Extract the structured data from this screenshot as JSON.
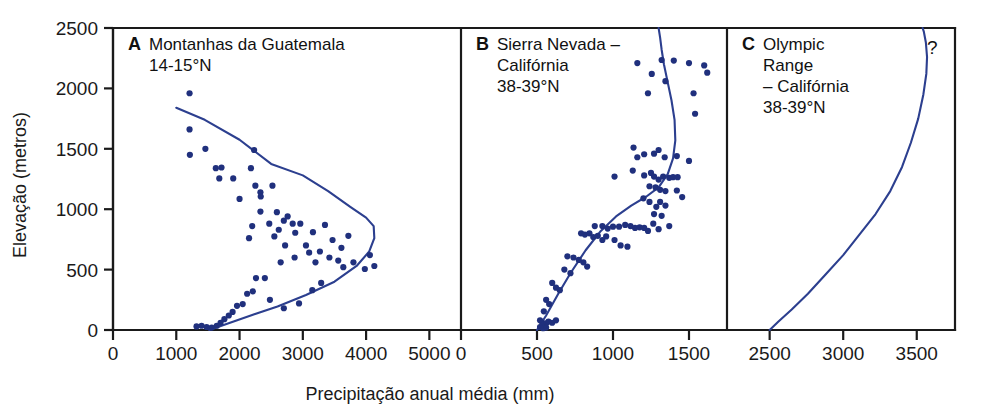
{
  "figure": {
    "axis_titles": {
      "x": "Precipitação anual média (mm)",
      "y": "Elevação (metros)"
    },
    "colors": {
      "point": "#20307d",
      "curve": "#2c3f8f",
      "axis": "#1a1a1a",
      "background": "#ffffff"
    }
  },
  "chart_data": {
    "type": "scatter",
    "title": "",
    "xlabel": "Precipitação anual média (mm)",
    "ylabel": "Elevação (metros)",
    "grid": false,
    "legend": "none",
    "shared_y": {
      "label": "Elevação (metros)",
      "ticks": [
        0,
        500,
        1000,
        1500,
        2000,
        2500
      ],
      "ylim": [
        0,
        2500
      ]
    },
    "panels": [
      {
        "letter": "A",
        "title_lines": [
          "Montanhas da Guatemala",
          "14-15°N"
        ],
        "region": "Montanhas da Guatemala",
        "latitude": "14-15°N",
        "xlim": [
          0,
          5500
        ],
        "xticks": [
          0,
          1000,
          2000,
          3000,
          4000,
          5000
        ],
        "xtick_labels": [
          "0",
          "1000",
          "2000",
          "3000",
          "4000",
          "5000"
        ],
        "annotation": "",
        "points": [
          [
            1210,
            1960
          ],
          [
            1210,
            1660
          ],
          [
            1215,
            1450
          ],
          [
            1460,
            1500
          ],
          [
            1625,
            1340
          ],
          [
            1680,
            1255
          ],
          [
            1715,
            1345
          ],
          [
            1900,
            1255
          ],
          [
            2000,
            1085
          ],
          [
            2180,
            1340
          ],
          [
            2230,
            1490
          ],
          [
            2250,
            1195
          ],
          [
            2330,
            1140
          ],
          [
            2335,
            1105
          ],
          [
            2520,
            1195
          ],
          [
            2590,
            975
          ],
          [
            2330,
            980
          ],
          [
            2200,
            860
          ],
          [
            2150,
            760
          ],
          [
            2470,
            880
          ],
          [
            2550,
            775
          ],
          [
            2620,
            830
          ],
          [
            2700,
            905
          ],
          [
            2720,
            700
          ],
          [
            2760,
            940
          ],
          [
            2840,
            880
          ],
          [
            2880,
            805
          ],
          [
            2960,
            880
          ],
          [
            3050,
            700
          ],
          [
            3100,
            640
          ],
          [
            3160,
            810
          ],
          [
            3200,
            560
          ],
          [
            3270,
            650
          ],
          [
            3350,
            870
          ],
          [
            3420,
            600
          ],
          [
            3470,
            745
          ],
          [
            3560,
            575
          ],
          [
            3610,
            680
          ],
          [
            3640,
            520
          ],
          [
            3720,
            780
          ],
          [
            3800,
            560
          ],
          [
            3980,
            505
          ],
          [
            4060,
            620
          ],
          [
            4130,
            530
          ],
          [
            2870,
            600
          ],
          [
            2650,
            560
          ],
          [
            2400,
            430
          ],
          [
            2260,
            430
          ],
          [
            2210,
            320
          ],
          [
            2120,
            300
          ],
          [
            2050,
            215
          ],
          [
            1960,
            200
          ],
          [
            1890,
            150
          ],
          [
            1830,
            120
          ],
          [
            1760,
            90
          ],
          [
            1700,
            60
          ],
          [
            1640,
            35
          ],
          [
            1560,
            20
          ],
          [
            1480,
            25
          ],
          [
            1400,
            35
          ],
          [
            1320,
            30
          ],
          [
            2480,
            250
          ],
          [
            2700,
            180
          ],
          [
            2940,
            220
          ],
          [
            3150,
            330
          ],
          [
            3290,
            390
          ]
        ],
        "curve": [
          [
            1000,
            1840
          ],
          [
            1450,
            1740
          ],
          [
            2000,
            1575
          ],
          [
            2500,
            1375
          ],
          [
            3000,
            1280
          ],
          [
            3400,
            1150
          ],
          [
            3750,
            1020
          ],
          [
            4000,
            930
          ],
          [
            4120,
            860
          ],
          [
            4130,
            760
          ],
          [
            4050,
            650
          ],
          [
            3850,
            530
          ],
          [
            3500,
            400
          ],
          [
            3050,
            290
          ],
          [
            2600,
            195
          ],
          [
            2200,
            125
          ],
          [
            1850,
            60
          ],
          [
            1580,
            10
          ],
          [
            1520,
            0
          ]
        ]
      },
      {
        "letter": "B",
        "title_lines": [
          "Sierra Nevada –",
          "Califórnia",
          "38-39°N"
        ],
        "region": "Sierra Nevada – Califórnia",
        "latitude": "38-39°N",
        "xlim": [
          0,
          1750
        ],
        "xticks": [
          0,
          500,
          1000,
          1500
        ],
        "xtick_labels": [
          "0",
          "500",
          "1000",
          "1500"
        ],
        "annotation": "",
        "points": [
          [
            1160,
            2210
          ],
          [
            1320,
            2235
          ],
          [
            1400,
            2230
          ],
          [
            1500,
            2210
          ],
          [
            1255,
            2120
          ],
          [
            1345,
            2060
          ],
          [
            1230,
            1960
          ],
          [
            1530,
            1960
          ],
          [
            1600,
            2190
          ],
          [
            1620,
            2130
          ],
          [
            1540,
            1790
          ],
          [
            1135,
            1510
          ],
          [
            1160,
            1430
          ],
          [
            1205,
            1455
          ],
          [
            1270,
            1460
          ],
          [
            1300,
            1490
          ],
          [
            1340,
            1430
          ],
          [
            1420,
            1440
          ],
          [
            1500,
            1400
          ],
          [
            1010,
            1270
          ],
          [
            1130,
            1320
          ],
          [
            1205,
            1280
          ],
          [
            1250,
            1300
          ],
          [
            1270,
            1270
          ],
          [
            1300,
            1245
          ],
          [
            1330,
            1270
          ],
          [
            1370,
            1260
          ],
          [
            1395,
            1265
          ],
          [
            1425,
            1265
          ],
          [
            1240,
            1190
          ],
          [
            1280,
            1180
          ],
          [
            1310,
            1160
          ],
          [
            1345,
            1150
          ],
          [
            1420,
            1155
          ],
          [
            1455,
            1100
          ],
          [
            1200,
            1090
          ],
          [
            1240,
            1060
          ],
          [
            1285,
            1020
          ],
          [
            1310,
            1060
          ],
          [
            1345,
            1030
          ],
          [
            1270,
            960
          ],
          [
            1320,
            945
          ],
          [
            880,
            860
          ],
          [
            930,
            860
          ],
          [
            965,
            840
          ],
          [
            1000,
            855
          ],
          [
            1040,
            855
          ],
          [
            1080,
            870
          ],
          [
            1115,
            860
          ],
          [
            1145,
            845
          ],
          [
            1175,
            850
          ],
          [
            1205,
            845
          ],
          [
            1230,
            820
          ],
          [
            1265,
            880
          ],
          [
            1300,
            835
          ],
          [
            1370,
            860
          ],
          [
            790,
            800
          ],
          [
            815,
            790
          ],
          [
            845,
            800
          ],
          [
            870,
            770
          ],
          [
            900,
            780
          ],
          [
            930,
            745
          ],
          [
            955,
            775
          ],
          [
            1010,
            745
          ],
          [
            1050,
            700
          ],
          [
            1095,
            690
          ],
          [
            700,
            610
          ],
          [
            740,
            600
          ],
          [
            775,
            580
          ],
          [
            805,
            560
          ],
          [
            830,
            525
          ],
          [
            680,
            500
          ],
          [
            720,
            470
          ],
          [
            600,
            390
          ],
          [
            625,
            350
          ],
          [
            650,
            330
          ],
          [
            560,
            250
          ],
          [
            580,
            215
          ],
          [
            545,
            155
          ],
          [
            520,
            80
          ],
          [
            535,
            60
          ],
          [
            545,
            45
          ],
          [
            560,
            55
          ],
          [
            575,
            70
          ],
          [
            600,
            60
          ],
          [
            625,
            80
          ],
          [
            520,
            25
          ],
          [
            540,
            15
          ],
          [
            560,
            20
          ]
        ],
        "curve": [
          [
            500,
            0
          ],
          [
            560,
            120
          ],
          [
            640,
            300
          ],
          [
            720,
            470
          ],
          [
            820,
            660
          ],
          [
            920,
            820
          ],
          [
            1020,
            940
          ],
          [
            1120,
            1030
          ],
          [
            1220,
            1105
          ],
          [
            1300,
            1180
          ],
          [
            1360,
            1290
          ],
          [
            1395,
            1420
          ],
          [
            1410,
            1570
          ],
          [
            1405,
            1740
          ],
          [
            1385,
            1900
          ],
          [
            1360,
            2050
          ],
          [
            1335,
            2200
          ],
          [
            1320,
            2320
          ],
          [
            1310,
            2420
          ],
          [
            1300,
            2500
          ]
        ]
      },
      {
        "letter": "C",
        "title_lines": [
          "Olympic",
          "Range",
          "– Califórnia",
          "38-39°N"
        ],
        "region": "Olympic Range – Califórnia",
        "latitude": "38-39°N",
        "xlim": [
          2210,
          3760
        ],
        "xticks": [
          2500,
          3000,
          3500
        ],
        "xtick_labels": [
          "2500",
          "3000",
          "3500"
        ],
        "annotation": "?",
        "points": [],
        "curve": [
          [
            2500,
            0
          ],
          [
            2560,
            70
          ],
          [
            2650,
            170
          ],
          [
            2760,
            300
          ],
          [
            2880,
            460
          ],
          [
            3000,
            620
          ],
          [
            3110,
            790
          ],
          [
            3220,
            960
          ],
          [
            3320,
            1150
          ],
          [
            3400,
            1350
          ],
          [
            3460,
            1550
          ],
          [
            3510,
            1750
          ],
          [
            3545,
            1950
          ],
          [
            3565,
            2120
          ],
          [
            3570,
            2260
          ],
          [
            3562,
            2380
          ],
          [
            3548,
            2470
          ],
          [
            3540,
            2500
          ]
        ]
      }
    ]
  }
}
